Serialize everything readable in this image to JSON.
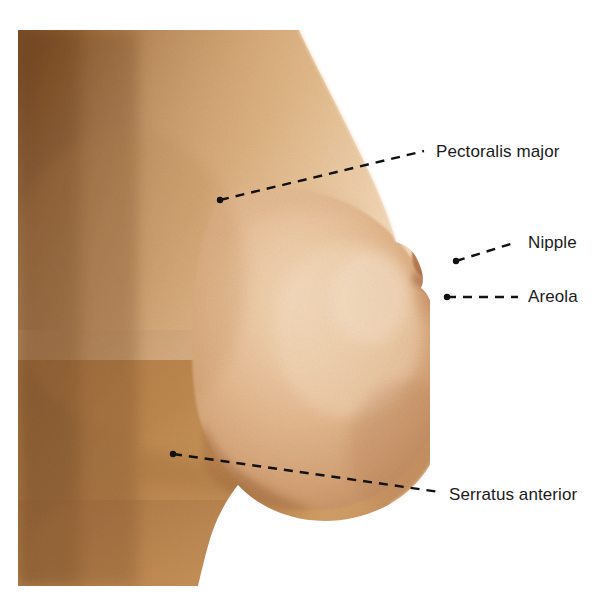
{
  "figure": {
    "type": "anatomical-photograph",
    "background_color": "#ffffff"
  },
  "photo": {
    "name": "breast-lateral-photograph",
    "left": 18,
    "top": 30,
    "width": 412,
    "height": 556,
    "skin_colors": {
      "shadow_upper_left": "#8a5a30",
      "mid_torso": "#c08b56",
      "lower_left": "#b07c47",
      "breast_highlight": "#edc9a3",
      "breast_mid": "#e2b489",
      "breast_shadow": "#c99a6e",
      "areola": "#c78f64",
      "nipple": "#b87a54",
      "edge_light": "#f2dcc4"
    }
  },
  "annotations": {
    "leader_color": "#111111",
    "dash_pattern": "9 7",
    "items": [
      {
        "id": "pectoralis-major",
        "label": "Pectoralis major",
        "dot": {
          "x": 220,
          "y": 200
        },
        "line_end": {
          "x": 424,
          "y": 151
        },
        "text_position": {
          "x": 436,
          "y": 142
        }
      },
      {
        "id": "nipple",
        "label": "Nipple",
        "dot": {
          "x": 456,
          "y": 261
        },
        "line_end": {
          "x": 517,
          "y": 242
        },
        "text_position": {
          "x": 528,
          "y": 233
        }
      },
      {
        "id": "areola",
        "label": "Areola",
        "dot": {
          "x": 447,
          "y": 297
        },
        "line_end": {
          "x": 518,
          "y": 297
        },
        "text_position": {
          "x": 528,
          "y": 287
        }
      },
      {
        "id": "serratus-anterior",
        "label": "Serratus anterior",
        "dot": {
          "x": 173,
          "y": 454
        },
        "line_end": {
          "x": 440,
          "y": 492
        },
        "text_position": {
          "x": 449,
          "y": 485
        }
      }
    ]
  }
}
